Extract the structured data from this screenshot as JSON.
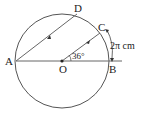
{
  "diagram": {
    "type": "geometry-circle",
    "points": {
      "A": {
        "label": "A"
      },
      "B": {
        "label": "B"
      },
      "C": {
        "label": "C"
      },
      "D": {
        "label": "D"
      },
      "O": {
        "label": "O"
      }
    },
    "angle_label": "36°",
    "arc_label": "2π cm",
    "colors": {
      "stroke": "#555555",
      "text": "#222222"
    }
  }
}
